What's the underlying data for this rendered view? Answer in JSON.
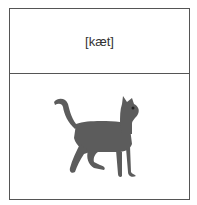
{
  "card": {
    "transcription": "[kæt]",
    "image": {
      "subject": "cat",
      "icon": "cat-image",
      "color": "#5a5a5a"
    },
    "border_color": "#555555"
  }
}
